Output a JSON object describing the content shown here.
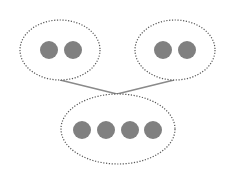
{
  "diagram": {
    "colors": {
      "background": "#ffffff",
      "dot_fill": "#808080",
      "outline": "#555555",
      "connector": "#8a8a8a"
    },
    "groups": [
      {
        "id": "left-group",
        "ellipse": {
          "cx": 60,
          "cy": 50,
          "rx": 40,
          "ry": 30
        },
        "dots": [
          {
            "cx": 49,
            "cy": 50
          },
          {
            "cx": 73,
            "cy": 50
          }
        ]
      },
      {
        "id": "right-group",
        "ellipse": {
          "cx": 175,
          "cy": 50,
          "rx": 40,
          "ry": 30
        },
        "dots": [
          {
            "cx": 163,
            "cy": 50
          },
          {
            "cx": 187,
            "cy": 50
          }
        ]
      },
      {
        "id": "bottom-group",
        "ellipse": {
          "cx": 118,
          "cy": 129,
          "rx": 57,
          "ry": 35
        },
        "dots": [
          {
            "cx": 82,
            "cy": 130
          },
          {
            "cx": 106,
            "cy": 130
          },
          {
            "cx": 130,
            "cy": 130
          },
          {
            "cx": 153,
            "cy": 130
          }
        ]
      }
    ],
    "dot_radius": 9,
    "connectors": [
      {
        "from": "left-group",
        "x1": 60,
        "y1": 80,
        "x2": 117,
        "y2": 94
      },
      {
        "from": "right-group",
        "x1": 174,
        "y1": 80,
        "x2": 117,
        "y2": 94
      }
    ]
  }
}
